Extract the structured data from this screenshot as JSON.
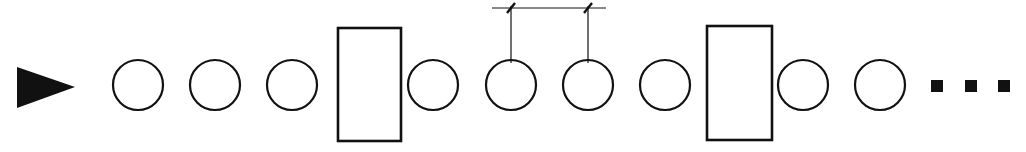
{
  "diagram": {
    "colors": {
      "stroke": "#111111",
      "fill": "#111111",
      "background": "#ffffff"
    },
    "start_arrow": {
      "points": "17,67 75,87 17,108",
      "icon": "play-triangle"
    },
    "circle_radius": 25,
    "center_y": 85,
    "elements": [
      {
        "type": "circle",
        "cx": 138
      },
      {
        "type": "circle",
        "cx": 215
      },
      {
        "type": "circle",
        "cx": 292
      },
      {
        "type": "rect",
        "x": 338,
        "y": 28,
        "w": 63,
        "h": 113
      },
      {
        "type": "circle",
        "cx": 433
      },
      {
        "type": "circle",
        "cx": 511
      },
      {
        "type": "circle",
        "cx": 588
      },
      {
        "type": "circle",
        "cx": 665
      },
      {
        "type": "rect",
        "x": 707,
        "y": 26,
        "w": 65,
        "h": 114
      },
      {
        "type": "circle",
        "cx": 803
      },
      {
        "type": "circle",
        "cx": 880
      }
    ],
    "dimension": {
      "line_y": 8,
      "x_start": 492,
      "x_end": 606,
      "marks": [
        511,
        588
      ],
      "extension_bottom_y": 63
    },
    "continuation_dots": [
      {
        "x": 931,
        "y": 80,
        "size": 12
      },
      {
        "x": 965,
        "y": 80,
        "size": 12
      },
      {
        "x": 998,
        "y": 80,
        "size": 12
      }
    ]
  }
}
